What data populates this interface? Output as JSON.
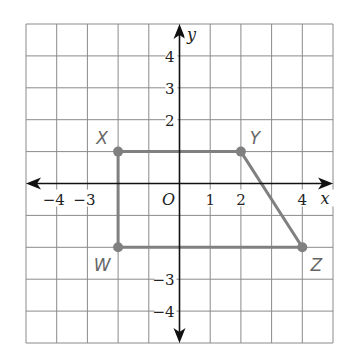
{
  "figure": {
    "type": "coordinate-plane",
    "grid": {
      "xmin": -5,
      "xmax": 5,
      "ymin": -5,
      "ymax": 5,
      "step": 1
    },
    "axes": {
      "x_label": "x",
      "y_label": "y",
      "origin_label": "O",
      "x_tick_labels": [
        {
          "value": -4,
          "text": "−4"
        },
        {
          "value": -3,
          "text": "−3"
        },
        {
          "value": 1,
          "text": "1"
        },
        {
          "value": 2,
          "text": "2"
        },
        {
          "value": 4,
          "text": "4"
        }
      ],
      "y_tick_labels": [
        {
          "value": 4,
          "text": "4"
        },
        {
          "value": 3,
          "text": "3"
        },
        {
          "value": 2,
          "text": "2"
        },
        {
          "value": -3,
          "text": "−3"
        },
        {
          "value": -4,
          "text": "−4"
        }
      ]
    },
    "polygon": {
      "name": "WXYZ",
      "vertices": [
        {
          "label": "X",
          "x": -2,
          "y": 1
        },
        {
          "label": "Y",
          "x": 2,
          "y": 1
        },
        {
          "label": "Z",
          "x": 4,
          "y": -2
        },
        {
          "label": "W",
          "x": -2,
          "y": -2
        }
      ],
      "color": "#808080"
    },
    "colors": {
      "grid": "#8a8a8a",
      "axis": "#111111",
      "polygon": "#808080",
      "label": "#666666"
    }
  }
}
